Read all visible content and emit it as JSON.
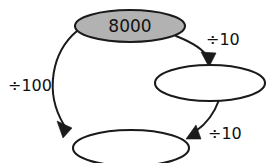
{
  "diagram": {
    "background_color": "#ffffff",
    "stroke_color": "#1a1a1a",
    "filled_node_color": "#b2b2b2",
    "empty_node_color": "#ffffff",
    "nodes": [
      {
        "id": "start-node",
        "label": "8000",
        "fill": "filled",
        "cx": 130,
        "cy": 26,
        "rx": 55,
        "ry": 16
      },
      {
        "id": "middle-right-node",
        "label": "",
        "fill": "empty",
        "cx": 210,
        "cy": 83,
        "rx": 55,
        "ry": 18
      },
      {
        "id": "bottom-node",
        "label": "",
        "fill": "empty",
        "cx": 131,
        "cy": 148,
        "rx": 58,
        "ry": 18
      }
    ],
    "edges": [
      {
        "id": "edge-divide-100",
        "label": "÷100",
        "from": "start-node",
        "to": "bottom-node",
        "label_x": 8,
        "label_y": 86
      },
      {
        "id": "edge-divide-10-top",
        "label": "÷10",
        "from": "start-node",
        "to": "middle-right-node",
        "label_x": 206,
        "label_y": 40
      },
      {
        "id": "edge-divide-10-bottom",
        "label": "÷10",
        "from": "middle-right-node",
        "to": "bottom-node",
        "label_x": 208,
        "label_y": 134
      }
    ],
    "watermark": {
      "line1": "",
      "line2": ""
    }
  }
}
